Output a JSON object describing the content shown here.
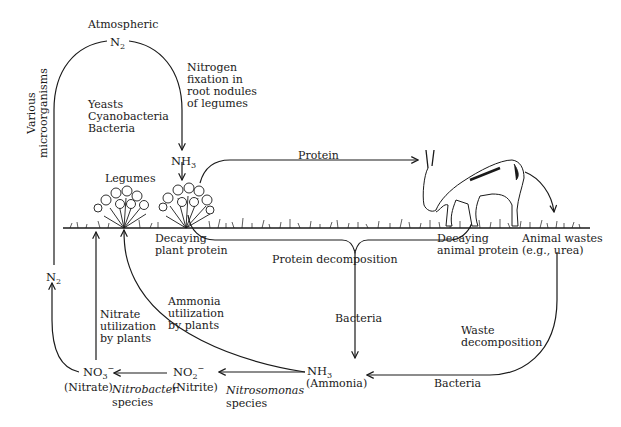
{
  "diagram": {
    "type": "nitrogen-cycle",
    "labels": {
      "atmospheric": "Atmospheric",
      "n2_top": {
        "base": "N",
        "sub": "2"
      },
      "fixation": [
        "Nitrogen",
        "fixation in",
        "root nodules",
        "of legumes"
      ],
      "fixers": [
        "Yeasts",
        "Cyanobacteria",
        "Bacteria"
      ],
      "nh3_top": {
        "base": "NH",
        "sub": "3"
      },
      "protein": "Protein",
      "legumes": "Legumes",
      "various_microorganisms": [
        "Various",
        "microorganisms"
      ],
      "decaying_plant": [
        "Decaying",
        "plant protein"
      ],
      "decaying_animal": [
        "Decaying",
        "animal protein"
      ],
      "animal_wastes": [
        "Animal wastes",
        "(e.g., urea)"
      ],
      "protein_decomposition": "Protein decomposition",
      "bacteria_center": "Bacteria",
      "waste_decomposition": [
        "Waste",
        "decomposition"
      ],
      "bacteria_bottom": "Bacteria",
      "n2_left": {
        "base": "N",
        "sub": "2"
      },
      "nitrate_utilization": [
        "Nitrate",
        "utilization",
        "by plants"
      ],
      "ammonia_utilization": [
        "Ammonia",
        "utilization",
        "by plants"
      ],
      "no3": {
        "base": "NO",
        "sub": "3",
        "sup": "−"
      },
      "nitrate": "(Nitrate)",
      "nitrobacter": "Nitrobacter",
      "nitrobacter_species": "species",
      "no2": {
        "base": "NO",
        "sub": "2",
        "sup": "−"
      },
      "nitrite": "(Nitrite)",
      "nitrosomonas": "Nitrosomonas",
      "nitrosomonas_species": "species",
      "nh3_bottom": {
        "base": "NH",
        "sub": "3"
      },
      "ammonia": "(Ammonia)"
    },
    "colors": {
      "ink": "#1a1a1a",
      "background": "#ffffff"
    }
  }
}
